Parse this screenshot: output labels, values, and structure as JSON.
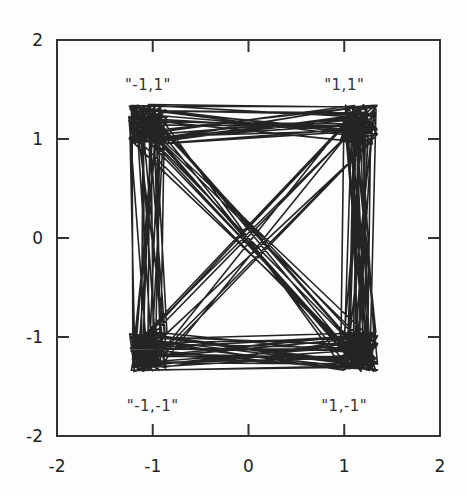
{
  "chart_data": {
    "type": "line",
    "title": "",
    "xlabel": "",
    "ylabel": "",
    "xlim": [
      -2,
      2
    ],
    "ylim": [
      -2,
      2
    ],
    "grid": false,
    "legend": null,
    "x_ticks": [
      -2,
      -1,
      0,
      1,
      2
    ],
    "y_ticks": [
      -2,
      -1,
      0,
      1,
      2
    ],
    "x_tick_labels": [
      "-2",
      "-1",
      "0",
      "1",
      "2"
    ],
    "y_tick_labels": [
      "-2",
      "-1",
      "0",
      "1",
      "2"
    ],
    "annotations": [
      {
        "text": "\"-1,1\"",
        "x": -1.05,
        "y": 1.55
      },
      {
        "text": "\"1,1\"",
        "x": 1.0,
        "y": 1.55
      },
      {
        "text": "\"-1,-1\"",
        "x": -1.0,
        "y": -1.7
      },
      {
        "text": "\"1,-1\"",
        "x": 1.0,
        "y": -1.7
      }
    ],
    "series": [
      {
        "name": "trajectory",
        "color": "#111111",
        "description": "Single dense trajectory switching among four corner attractors at (-1,1), (1,1), (-1,-1), (1,-1); cluster extent approx x in [-1.3,-0.85] and [0.95,1.35], y in [0.95,1.35] and [-1.4,-0.95]; frequent straight transitions along edges and both diagonals",
        "attractors": [
          {
            "label": "-1,1",
            "x": -1.05,
            "y": 1.15
          },
          {
            "label": "1,1",
            "x": 1.15,
            "y": 1.15
          },
          {
            "label": "-1,-1",
            "x": -1.05,
            "y": -1.15
          },
          {
            "label": "1,-1",
            "x": 1.15,
            "y": -1.15
          }
        ],
        "cluster_half_width": 0.2,
        "cluster_half_height": 0.2,
        "num_transitions": 140,
        "points_per_dwell": 6,
        "seed": 7
      }
    ]
  },
  "axes": {
    "frame_color": "#333333",
    "tick_length_px": 12
  }
}
